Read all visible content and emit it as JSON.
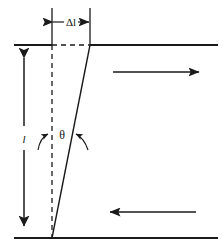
{
  "figure": {
    "background_color": "#ffffff",
    "line_color": "#1a1a1a",
    "labels": {
      "displacement": "Δl",
      "angle": "θ",
      "height": "l"
    },
    "annotations": {
      "top_force_direction": "right",
      "bottom_force_direction": "left",
      "height_dimension_style": "double-headed vertical arrow",
      "displacement_dimension_style": "double-headed horizontal arrow",
      "angle_marker_style": "two curved arrows"
    },
    "geometry": {
      "top_line_y": 45,
      "bottom_line_y": 238,
      "line_left_x": 14,
      "line_right_x": 218,
      "vertical_dashed_x": 52,
      "slanted_top_x": 90,
      "slanted_bottom_x": 52,
      "dim_arrow_x": 24,
      "extension_top_y": 8,
      "delta_arrow_y": 22,
      "top_force_arrow_y": 72,
      "bottom_force_arrow_y": 212
    }
  }
}
